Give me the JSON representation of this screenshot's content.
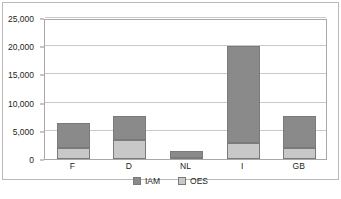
{
  "chart_data": {
    "type": "bar",
    "stacked": true,
    "title": "",
    "subtitle": "",
    "xlabel": "",
    "ylabel": "",
    "categories": [
      "F",
      "D",
      "NL",
      "I",
      "GB"
    ],
    "series": [
      {
        "name": "OES",
        "color": "#c8c8c8",
        "values": [
          2000,
          3400,
          100,
          2800,
          2000
        ]
      },
      {
        "name": "IAM",
        "color": "#8a8a8a",
        "values": [
          4400,
          4300,
          1400,
          17200,
          5700
        ]
      }
    ],
    "totals": [
      6400,
      7700,
      1500,
      20000,
      7700
    ],
    "stack_order": [
      "OES",
      "IAM"
    ],
    "ylim": [
      0,
      25000
    ],
    "yticks": [
      0,
      5000,
      10000,
      15000,
      20000,
      25000
    ],
    "ytick_labels": [
      "0",
      "5,000",
      "10,000",
      "15,000",
      "20,000",
      "25,000"
    ],
    "grid": true,
    "legend": [
      "IAM",
      "OES"
    ],
    "legend_position": "bottom"
  },
  "axis": {
    "y_labels": [
      "25,000",
      "20,000",
      "15,000",
      "10,000",
      "5,000",
      "0"
    ],
    "x_labels": [
      "F",
      "D",
      "NL",
      "I",
      "GB"
    ]
  },
  "legend": {
    "items": [
      {
        "label": "IAM",
        "color": "#8a8a8a"
      },
      {
        "label": "OES",
        "color": "#c8c8c8"
      }
    ]
  },
  "colors": {
    "iam": "#8a8a8a",
    "oes": "#c8c8c8",
    "gridline": "#c9c9c9",
    "plot_border": "#a8a8a8",
    "frame": "#b9b9b9",
    "text": "#231f20"
  }
}
